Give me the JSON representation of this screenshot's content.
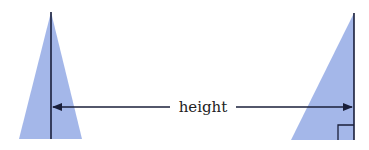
{
  "diagram": {
    "label": "height",
    "fill_color": "#9fb3e8",
    "line_color": "#1a1f3a",
    "shapes": [
      {
        "name": "isosceles-triangle",
        "points": [
          [
            51,
            12
          ],
          [
            19,
            139
          ],
          [
            82,
            139
          ]
        ],
        "height_line": [
          [
            51,
            12
          ],
          [
            51,
            139
          ]
        ]
      },
      {
        "name": "right-triangle",
        "points": [
          [
            354,
            13
          ],
          [
            291,
            140
          ],
          [
            354,
            140
          ]
        ],
        "height_line": [
          [
            354,
            13
          ],
          [
            354,
            140
          ]
        ],
        "right_angle_marker": true
      }
    ]
  }
}
